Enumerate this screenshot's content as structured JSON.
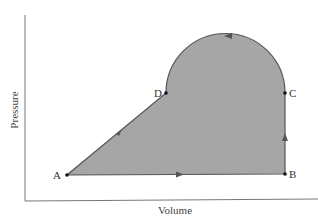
{
  "diagram": {
    "title": "",
    "x_axis_label": "Volume",
    "y_axis_label": "Pressure",
    "points": [
      {
        "label": "A",
        "x": 67,
        "y": 175
      },
      {
        "label": "B",
        "x": 285,
        "y": 174
      },
      {
        "label": "C",
        "x": 285,
        "y": 93
      },
      {
        "label": "D",
        "x": 166,
        "y": 93
      }
    ],
    "path_segments": [
      {
        "from": "A",
        "to": "B",
        "shape": "line",
        "direction": "A→B"
      },
      {
        "from": "B",
        "to": "C",
        "shape": "line",
        "direction": "B→C"
      },
      {
        "from": "C",
        "to": "D",
        "shape": "semicircle arc",
        "direction": "C→D"
      },
      {
        "from": "D",
        "to": "A",
        "shape": "line",
        "direction": "D→A"
      }
    ],
    "colors": {
      "fill": "#a6a6a6",
      "stroke": "#555555",
      "axis": "#666666"
    }
  }
}
